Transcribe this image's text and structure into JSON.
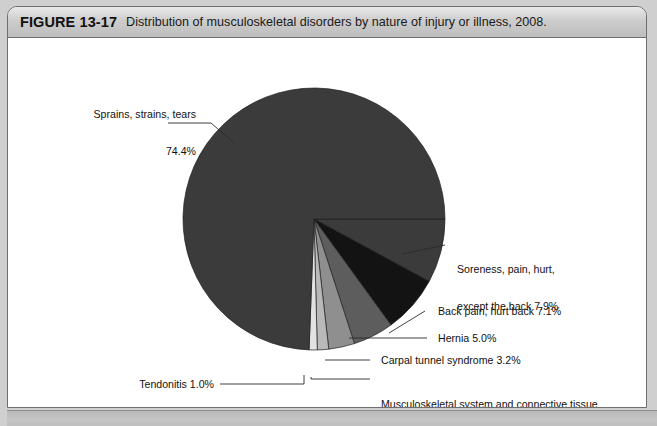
{
  "figure": {
    "number": "FIGURE 13-17",
    "caption": "Distribution of musculoskeletal disorders by nature of injury or illness, 2008."
  },
  "footer": {
    "text": ""
  },
  "chart_data": {
    "type": "pie",
    "title": "Distribution of musculoskeletal disorders by nature of injury or illness, 2008.",
    "units": "percent",
    "start_angle_deg": 0,
    "direction": "clockwise",
    "legend": "none",
    "grid": false,
    "categories": [
      "Soreness, pain, hurt, except the back",
      "Back pain, hurt back",
      "Hernia",
      "Carpal tunnel syndrome",
      "Musculoskeletal system and connective tissue diseases and disorders, except tendonitis",
      "Tendonitis",
      "Sprains, strains, tears"
    ],
    "values": [
      7.9,
      7.1,
      5.0,
      3.2,
      1.4,
      1.0,
      74.4
    ],
    "colors": [
      "#3b3b3b",
      "#131313",
      "#5d5d5d",
      "#8f8f8f",
      "#b9b9b9",
      "#e2e2e2",
      "#3b3b3b"
    ],
    "slices": [
      {
        "label": "Soreness, pain, hurt, except the back",
        "value": 7.9,
        "color": "#3b3b3b"
      },
      {
        "label": "Back pain, hurt back",
        "value": 7.1,
        "color": "#131313"
      },
      {
        "label": "Hernia",
        "value": 5.0,
        "color": "#5d5d5d"
      },
      {
        "label": "Carpal tunnel syndrome",
        "value": 3.2,
        "color": "#8f8f8f"
      },
      {
        "label": "Musculoskeletal system and connective tissue diseases and disorders, except tendonitis",
        "value": 1.4,
        "color": "#b9b9b9"
      },
      {
        "label": "Tendonitis",
        "value": 1.0,
        "color": "#e2e2e2"
      },
      {
        "label": "Sprains, strains, tears",
        "value": 74.4,
        "color": "#3b3b3b"
      }
    ]
  },
  "labels": {
    "sprains_line1": "Sprains, strains, tears",
    "sprains_line2": "74.4%",
    "soreness_line1": "Soreness, pain, hurt,",
    "soreness_line2": "except the back 7.9%",
    "backpain": "Back pain, hurt back 7.1%",
    "hernia": "Hernia 5.0%",
    "carpal": "Carpal tunnel syndrome 3.2%",
    "msd_line1": "Musculoskeletal system and connective tissue",
    "msd_line2": "diseases and disorders, except tendonitis 1.4%",
    "tendonitis": "Tendonitis 1.0%"
  }
}
